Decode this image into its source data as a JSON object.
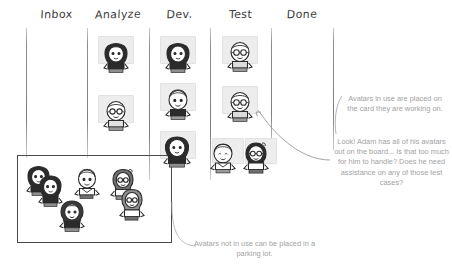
{
  "board": {
    "title": "Kanban board with avatars",
    "columns": [
      {
        "id": "inbox",
        "label": "Inbox",
        "card_count": 0
      },
      {
        "id": "analyze",
        "label": "Analyze",
        "card_count": 2
      },
      {
        "id": "dev",
        "label": "Dev.",
        "card_count": 3
      },
      {
        "id": "test",
        "label": "Test",
        "card_count": 4
      },
      {
        "id": "done",
        "label": "Done",
        "card_count": 0
      }
    ]
  },
  "parking_lot": {
    "label": "parking lot",
    "avatar_count": 6
  },
  "annotations": [
    {
      "id": "avatars-in-use",
      "text": "Avatars in use are placed on the card they are working on."
    },
    {
      "id": "adam-overloaded",
      "text": "Look! Adam has all of his avatars out on the board... Is that too much for him to handle? Does he need assistance on any of those test cases?"
    },
    {
      "id": "avatars-parking",
      "text": "Avatars not in use can be placed in a parking lot."
    }
  ],
  "colors": {
    "card_fill": "#ededed",
    "divider": "#7e7e7e",
    "note_text": "#a2a2a2",
    "header_text": "#3a3a3a",
    "ink": "#2b2b2b"
  }
}
